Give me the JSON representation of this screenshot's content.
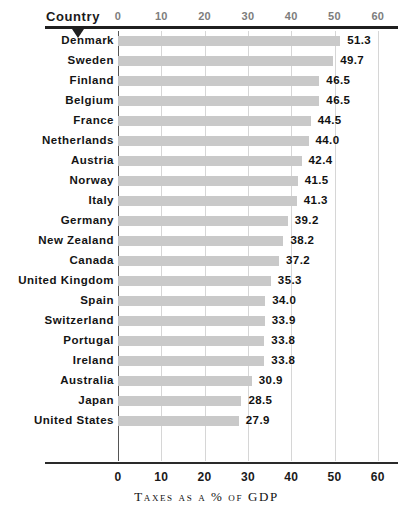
{
  "header": {
    "column_label": "Country",
    "sort_marker_icon": "sort-descending-triangle-icon"
  },
  "axis": {
    "title": "Taxes as a % of GDP",
    "ticks": [
      "0",
      "10",
      "20",
      "30",
      "40",
      "50",
      "60"
    ]
  },
  "colors": {
    "bar": "#c9c9c9",
    "rule": "#1f1f1f",
    "gridline": "#d6d6d6",
    "zero_line": "#555555",
    "label_text": "#141414",
    "tick_text_top": "#7d7d7d"
  },
  "chart_data": {
    "type": "bar",
    "orientation": "horizontal",
    "title": "",
    "xlabel": "Taxes as a % of GDP",
    "ylabel": "Country",
    "xlim": [
      0,
      60
    ],
    "xticks": [
      0,
      10,
      20,
      30,
      40,
      50,
      60
    ],
    "grid": true,
    "legend": "none",
    "data_labels": true,
    "sorted": "descending",
    "categories": [
      "Denmark",
      "Sweden",
      "Finland",
      "Belgium",
      "France",
      "Netherlands",
      "Austria",
      "Norway",
      "Italy",
      "Germany",
      "New Zealand",
      "Canada",
      "United Kingdom",
      "Spain",
      "Switzerland",
      "Portugal",
      "Ireland",
      "Australia",
      "Japan",
      "United States"
    ],
    "values": [
      51.3,
      49.7,
      46.5,
      46.5,
      44.5,
      44.0,
      42.4,
      41.5,
      41.3,
      39.2,
      38.2,
      37.2,
      35.3,
      34.0,
      33.9,
      33.8,
      33.8,
      30.9,
      28.5,
      27.9
    ],
    "value_labels": [
      "51.3",
      "49.7",
      "46.5",
      "46.5",
      "44.5",
      "44.0",
      "42.4",
      "41.5",
      "41.3",
      "39.2",
      "38.2",
      "37.2",
      "35.3",
      "34.0",
      "33.9",
      "33.8",
      "33.8",
      "30.9",
      "28.5",
      "27.9"
    ]
  }
}
